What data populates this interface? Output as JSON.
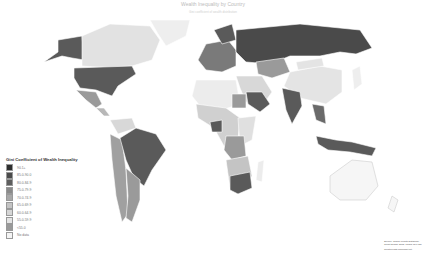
{
  "map": {
    "title": "Wealth Inequality by Country",
    "subtitle": "Gini coefficient of wealth distribution",
    "legend": {
      "title": "Gini Coefficient of Wealth Inequality",
      "items": [
        {
          "label": "90.1+",
          "color": "#2e2e2e"
        },
        {
          "label": "85.0-90.0",
          "color": "#4a4a4a"
        },
        {
          "label": "80.0-84.9",
          "color": "#5e5e5e"
        },
        {
          "label": "75.0-79.9",
          "color": "#8a8a8a"
        },
        {
          "label": "70.0-74.9",
          "color": "#a8a8a8"
        },
        {
          "label": "65.0-69.9",
          "color": "#c4c4c4"
        },
        {
          "label": "60.0-64.9",
          "color": "#d6d6d6"
        },
        {
          "label": "55.0-59.9",
          "color": "#e4e4e4"
        },
        {
          "label": "<55.0",
          "color": "#9a9a9a"
        },
        {
          "label": "No data",
          "color": "#f4f4f4"
        }
      ]
    },
    "source": "Source: Global Wealth Databook, Credit Suisse 2013, Pages 117-120",
    "credit": "Created with mapchart.net"
  }
}
